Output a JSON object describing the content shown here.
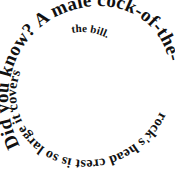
{
  "image": {
    "type": "spiral-text-graphic",
    "width": 175,
    "height": 171,
    "background_color": "#ffffff",
    "text_color": "#111111",
    "direction": "counterclockwise-inward",
    "start_position": "lower-left"
  },
  "content": {
    "full_text": "Did you know? A male cock-of-the-rock's head crest is so large it covers the bill.",
    "lead_in": "Did you know?",
    "fact": "A male cock-of-the-rock's head crest is so large it covers the bill."
  },
  "segments": [
    {
      "text": "Did you know? A male cock-of-the-",
      "loop": 1,
      "font_size": 19
    },
    {
      "text": "rock's head crest is so large it covers",
      "loop": 2,
      "font_size": 14
    },
    {
      "text": " the bill.",
      "loop": 3,
      "font_size": 11
    }
  ],
  "words": [
    "Did",
    "you",
    "know?",
    "A",
    "male",
    "cock-of-the-rock's",
    "head",
    "crest",
    "is",
    "so",
    "large",
    "it",
    "covers",
    "the",
    "bill."
  ]
}
